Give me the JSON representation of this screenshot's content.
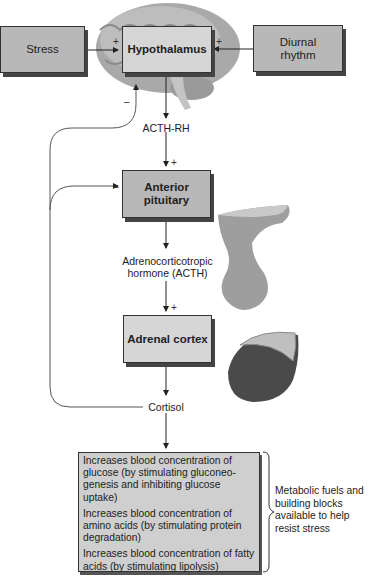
{
  "nodes": {
    "stress": "Stress",
    "hypothalamus": "Hypothalamus",
    "diurnal_rhythm": "Diurnal rhythm",
    "anterior_pituitary": "Anterior pituitary",
    "adrenal_cortex": "Adrenal cortex"
  },
  "hormones": {
    "acth_rh": "ACTH-RH",
    "acth_line1": "Adrenocorticotropic",
    "acth_line2": "hormone (ACTH)",
    "cortisol": "Cortisol"
  },
  "signs": {
    "stimulate": "+",
    "inhibit": "–"
  },
  "effects": [
    "Increases blood concentration of glucose (by stimulating gluconeo-genesis and inhibiting glucose uptake)",
    "Increases blood concentration of amino acids (by stimulating protein degradation)",
    "Increases blood concentration of fatty acids (by stimulating lipolysis)"
  ],
  "outcome": "Metabolic fuels and building blocks available to help resist stress",
  "illustrations": [
    "brain-illustration",
    "pituitary-illustration",
    "adrenal-gland-illustration"
  ],
  "colors": {
    "box_dark": "#b8b8b8",
    "box_light": "#d6d6d6",
    "line": "#333333"
  }
}
